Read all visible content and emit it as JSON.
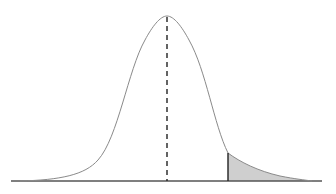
{
  "figure": {
    "type": "normal-distribution-curve",
    "colors": {
      "curve": "#8a8a8a",
      "baseline": "#555555",
      "mean_line": "#222222",
      "cutoff_line": "#222222",
      "tail_fill": "#cfcfcf"
    },
    "mean_x": 167,
    "peak_y": 16,
    "baseline_y": 181,
    "cutoff_x": 228,
    "axis_x_range": [
      11,
      322
    ]
  }
}
